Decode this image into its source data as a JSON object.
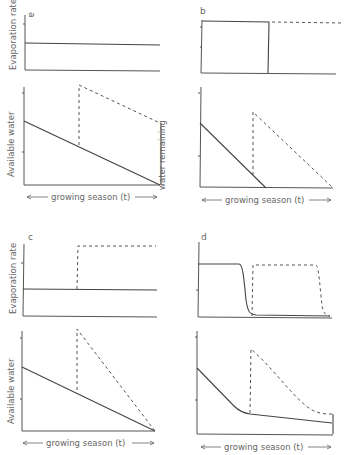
{
  "figure": {
    "panels": [
      {
        "id": "a",
        "letter": "a",
        "top_ylabel": "Evaporation rate",
        "bottom_ylabel": "Available water",
        "xlabel": "growing season (t)",
        "annotation": "water remaining"
      },
      {
        "id": "b",
        "letter": "b",
        "top_ylabel": "",
        "bottom_ylabel": "",
        "xlabel": "growing season (t)"
      },
      {
        "id": "c",
        "letter": "c",
        "top_ylabel": "Evaporation rate",
        "bottom_ylabel": "Available water",
        "xlabel": "growing season (t)"
      },
      {
        "id": "d",
        "letter": "d",
        "top_ylabel": "",
        "bottom_ylabel": "",
        "xlabel": "growing season (t)"
      }
    ],
    "legend_semantics": {
      "solid": "single plant / baseline",
      "dashed": "later-starting plant / alternative scenario"
    },
    "colors": {
      "line": "#444444",
      "axis": "#555555",
      "text": "#666666",
      "background": "#ffffff"
    }
  }
}
